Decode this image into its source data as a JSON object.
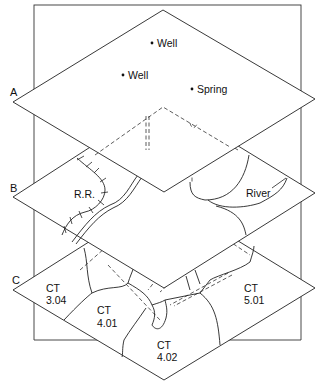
{
  "diagram": {
    "type": "gis-layer-overlay",
    "layers": [
      {
        "id": "A",
        "label": "A",
        "features": [
          {
            "kind": "point",
            "label": "Well"
          },
          {
            "kind": "point",
            "label": "Well"
          },
          {
            "kind": "point",
            "label": "Spring"
          }
        ]
      },
      {
        "id": "B",
        "label": "B",
        "features": [
          {
            "kind": "line",
            "label": "R.R."
          },
          {
            "kind": "line",
            "label": "River"
          }
        ]
      },
      {
        "id": "C",
        "label": "C",
        "tracts": [
          {
            "ct": "CT",
            "num": "3.04"
          },
          {
            "ct": "CT",
            "num": "4.01"
          },
          {
            "ct": "CT",
            "num": "4.02"
          },
          {
            "ct": "CT",
            "num": "5.01"
          }
        ]
      }
    ]
  }
}
